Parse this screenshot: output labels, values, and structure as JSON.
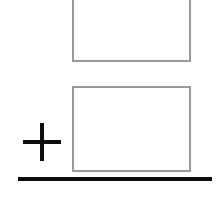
{
  "figure": {
    "title": "",
    "background_color": "#ffffff",
    "width": 221,
    "height": 202
  },
  "shapes": {
    "upper_rectangle": {
      "name": "upper-rectangle",
      "label": "",
      "stroke_color": "#9a9a9a",
      "fill_color": "#ffffff",
      "stroke_width": 2,
      "x": 72,
      "y": -30,
      "width": 119,
      "height": 92,
      "clipped_edge": "top"
    },
    "lower_rectangle": {
      "name": "lower-rectangle",
      "label": "",
      "stroke_color": "#9a9a9a",
      "fill_color": "#ffffff",
      "stroke_width": 2,
      "x": 72,
      "y": 86,
      "width": 119,
      "height": 86,
      "clipped_edge": "none"
    },
    "plus_sign": {
      "name": "plus-sign",
      "symbol": "+",
      "color": "#0d0d0d",
      "stroke_width": 4,
      "center_x": 42,
      "center_y": 142,
      "size": 38
    },
    "baseline": {
      "name": "ground-baseline",
      "color": "#0d0d0d",
      "thickness": 4,
      "x_start": 18,
      "x_end": 212,
      "y": 179
    }
  },
  "annotations": {
    "text_items": []
  }
}
